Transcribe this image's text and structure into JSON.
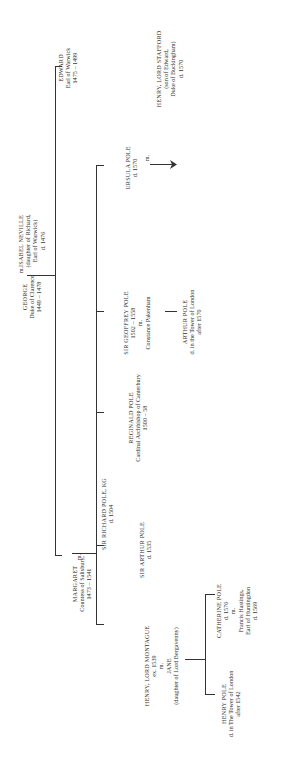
{
  "tree": {
    "george": {
      "name": "GEORGE",
      "title": "Duke of Clarence",
      "dates": "1449 – 1478"
    },
    "isabel": {
      "marriage": "m.",
      "name": "ISABEL NEVILLE",
      "note1": "(daughter of Richard,",
      "note2": "Earl of Warwick)",
      "dates": "d. 1476"
    },
    "edward": {
      "name": "EDWARD",
      "title": "Earl of Warwick",
      "dates": "1475 – 1499"
    },
    "margaret": {
      "name": "MARGARET",
      "title": "Countess of Salisbury,",
      "dates": "1473 – 1541"
    },
    "richard": {
      "marriage": "m.",
      "name": "SIR RICHARD POLE, KG",
      "dates": "d. 1504"
    },
    "montague": {
      "name": "HENRY, LORD MONTAGUE",
      "dates": "ex. 1539",
      "marriage": "m.",
      "spouse": "JANE",
      "spouse_note": "(daughter of Lord Bergavenny)"
    },
    "arthur": {
      "name": "SIR ARTHUR POLE",
      "dates": "d. 1535"
    },
    "reginald": {
      "name": "REGINALD POLE",
      "title": "Cardinal Archbishop of Canterbury",
      "dates": "1500 – 58"
    },
    "geoffrey": {
      "name": "SIR GEOFFREY POLE",
      "dates": "1502 – 1558",
      "marriage": "m.",
      "spouse": "Constance Pakenham"
    },
    "arthur_jr": {
      "name": "ARTHUR POLE",
      "note": "d. in the Tower of London",
      "dates": "after 1570"
    },
    "ursula": {
      "name": "URSULA POLE",
      "dates": "d. 1570",
      "marriage": "m."
    },
    "stafford": {
      "name": "HENRY, LORD STAFFORD",
      "note1": "(son of Edward,",
      "note2": "Duke of Buckingham)",
      "dates": "d. 1570"
    },
    "henry_pole": {
      "name": "HENRY POLE",
      "note": "d. in The Tower of London",
      "dates": "after 1542"
    },
    "catherine": {
      "name": "CATHERINE POLE",
      "dates": "d. 1576",
      "marriage": "m.",
      "spouse": "Francis Hastings,",
      "spouse_title": "Earl of Huntingdon",
      "spouse_dates": "d. 1569"
    }
  }
}
